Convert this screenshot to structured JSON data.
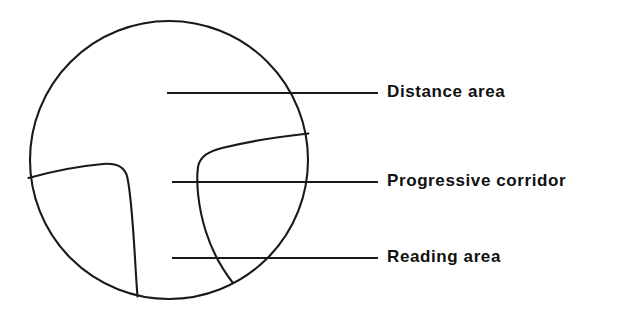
{
  "diagram": {
    "stroke_color": "#1a1a1a",
    "background_color": "#ffffff",
    "lens": {
      "shape": "circle",
      "center_x": 169,
      "center_y": 160,
      "radius": 140
    },
    "labels": [
      {
        "id": "distance-area",
        "text": "Distance area",
        "leader_line": {
          "x1": 167,
          "y1": 93,
          "x2": 378,
          "y2": 93
        }
      },
      {
        "id": "progressive-corridor",
        "text": "Progressive corridor",
        "leader_line": {
          "x1": 172,
          "y1": 182,
          "x2": 378,
          "y2": 182
        }
      },
      {
        "id": "reading-area",
        "text": "Reading area",
        "leader_line": {
          "x1": 172,
          "y1": 258,
          "x2": 378,
          "y2": 258
        }
      }
    ],
    "zones": [
      {
        "id": "left-blend-zone",
        "name": "left peripheral blend zone"
      },
      {
        "id": "right-blend-zone",
        "name": "right peripheral blend zone"
      }
    ]
  }
}
